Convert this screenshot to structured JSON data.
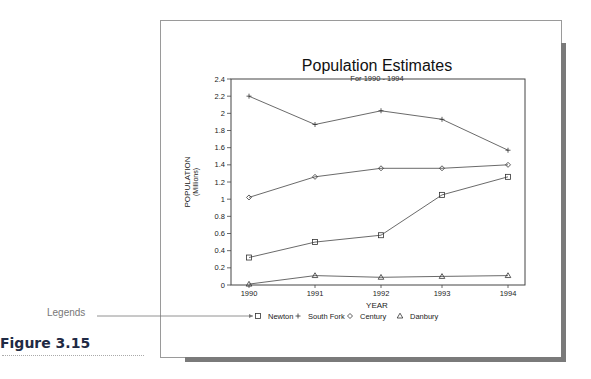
{
  "figure": {
    "label": "Figure 3.15",
    "callout": "Legends"
  },
  "chart_data": {
    "type": "line",
    "title": "Population Estimates",
    "subtitle": "For 1990 - 1994",
    "xlabel": "YEAR",
    "ylabel": "POPULATION",
    "ylabel_sub": "(Millions)",
    "categories": [
      "1990",
      "1991",
      "1992",
      "1993",
      "1994"
    ],
    "yticks": [
      "0",
      "0.2",
      "0.4",
      "0.6",
      "0.8",
      "1",
      "1.2",
      "1.4",
      "1.6",
      "1.8",
      "2",
      "2.2",
      "2.4"
    ],
    "ylim": [
      0,
      2.4
    ],
    "grid": false,
    "legend_position": "bottom",
    "series": [
      {
        "name": "Newton",
        "marker": "square",
        "symbol": "□",
        "values": [
          0.32,
          0.5,
          0.58,
          1.05,
          1.26
        ]
      },
      {
        "name": "South Fork",
        "marker": "plus",
        "symbol": "+",
        "values": [
          2.2,
          1.87,
          2.03,
          1.93,
          1.57
        ]
      },
      {
        "name": "Century",
        "marker": "diamond",
        "symbol": "◇",
        "values": [
          1.02,
          1.26,
          1.36,
          1.36,
          1.4
        ]
      },
      {
        "name": "Danbury",
        "marker": "triangle",
        "symbol": "△",
        "values": [
          0.01,
          0.11,
          0.09,
          0.1,
          0.11
        ]
      }
    ]
  }
}
